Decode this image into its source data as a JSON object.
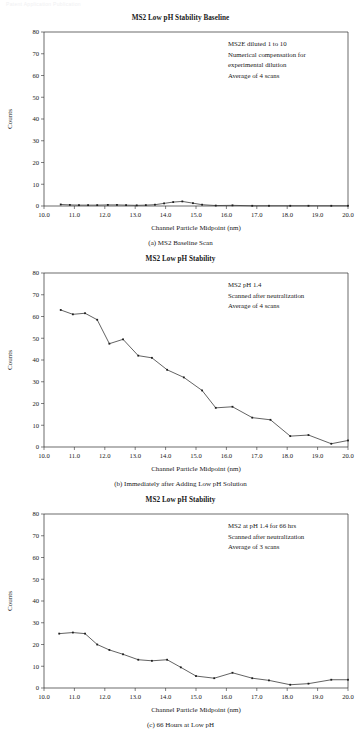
{
  "page": {
    "header_text": "Patent Application Publication"
  },
  "figure": {
    "axis": {
      "xlabel": "Channel Particle Midpoint (nm)",
      "ylabel": "Counts",
      "xticks": [
        "10.0",
        "11.0",
        "12.0",
        "13.0",
        "14.0",
        "15.0",
        "16.0",
        "17.0",
        "18.0",
        "19.0",
        "20.0"
      ],
      "yticks": [
        "0",
        "10",
        "20",
        "30",
        "40",
        "50",
        "60",
        "70",
        "80"
      ],
      "xlim": [
        10.0,
        20.0
      ],
      "ylim": [
        0,
        80
      ]
    },
    "panels": [
      {
        "id": "panel-a",
        "title": "MS2 Low pH Stability Baseline",
        "subcaption": "(a) MS2 Baseline Scan",
        "annotation": [
          "MS2E diluted 1 to 10",
          "Numerical compensation for",
          "experimental dilution",
          "Average of 4 scans"
        ]
      },
      {
        "id": "panel-b",
        "title": "MS2 Low pH Stability",
        "subcaption": "(b) Immediately after Adding Low pH Solution",
        "annotation": [
          "MS2 pH 1.4",
          "Scanned after neutralization",
          "Average of 4 scans"
        ]
      },
      {
        "id": "panel-c",
        "title": "MS2 Low pH Stability",
        "subcaption": "(c) 66 Hours at Low pH",
        "annotation": [
          "MS2 at pH 1.4 for 66 hrs",
          "Scanned after neutralization",
          "Average of 3 scans"
        ]
      }
    ]
  },
  "chart_data": [
    {
      "type": "line",
      "title": "MS2 Low pH Stability Baseline",
      "xlabel": "Channel Particle Midpoint (nm)",
      "ylabel": "Counts",
      "xlim": [
        10.0,
        20.0
      ],
      "ylim": [
        0,
        80
      ],
      "grid": false,
      "legend": null,
      "annotations": [
        "MS2E diluted 1 to 10",
        "Numerical compensation for",
        "experimental dilution",
        "Average of 4 scans"
      ],
      "x": [
        10.55,
        10.85,
        11.15,
        11.45,
        11.75,
        12.1,
        12.4,
        12.7,
        13.05,
        13.35,
        13.65,
        13.95,
        14.25,
        14.55,
        14.9,
        15.2,
        15.65,
        16.2,
        16.85,
        17.4,
        18.1,
        18.7,
        19.45,
        20.0
      ],
      "y": [
        0.7,
        0.5,
        0.4,
        0.4,
        0.4,
        0.5,
        0.5,
        0.4,
        0.3,
        0.4,
        0.6,
        1.2,
        1.8,
        2.1,
        1.3,
        0.6,
        0.2,
        0.3,
        0.1,
        0.1,
        0.1,
        0.1,
        0.1,
        0.1
      ]
    },
    {
      "type": "line",
      "title": "MS2 Low pH Stability",
      "xlabel": "Channel Particle Midpoint (nm)",
      "ylabel": "Counts",
      "xlim": [
        10.0,
        20.0
      ],
      "ylim": [
        0,
        80
      ],
      "grid": false,
      "legend": null,
      "annotations": [
        "MS2 pH 1.4",
        "Scanned after neutralization",
        "Average of 4 scans"
      ],
      "x": [
        10.55,
        10.95,
        11.35,
        11.75,
        12.15,
        12.6,
        13.1,
        13.55,
        14.05,
        14.6,
        15.2,
        15.65,
        16.2,
        16.85,
        17.45,
        18.1,
        18.7,
        19.45,
        20.0
      ],
      "y": [
        63.0,
        61.0,
        61.5,
        58.5,
        47.5,
        49.5,
        42.0,
        41.0,
        35.5,
        32.0,
        26.0,
        18.0,
        18.5,
        13.5,
        12.5,
        5.0,
        5.5,
        1.5,
        3.0
      ]
    },
    {
      "type": "line",
      "title": "MS2 Low pH Stability",
      "xlabel": "Channel Particle Midpoint (nm)",
      "ylabel": "Counts",
      "xlim": [
        10.0,
        20.0
      ],
      "ylim": [
        0,
        80
      ],
      "grid": false,
      "legend": null,
      "annotations": [
        "MS2 at pH 1.4 for 66 hrs",
        "Scanned after neutralization",
        "Average of 3 scans"
      ],
      "x": [
        10.5,
        10.95,
        11.35,
        11.75,
        12.15,
        12.6,
        13.1,
        13.55,
        14.05,
        14.5,
        15.0,
        15.6,
        16.2,
        16.85,
        17.4,
        18.1,
        18.7,
        19.45,
        20.0
      ],
      "y": [
        25.0,
        25.5,
        25.0,
        20.0,
        17.5,
        15.5,
        13.0,
        12.5,
        13.0,
        9.5,
        5.5,
        4.5,
        7.0,
        4.5,
        3.5,
        1.5,
        2.0,
        3.8,
        3.8
      ]
    }
  ]
}
